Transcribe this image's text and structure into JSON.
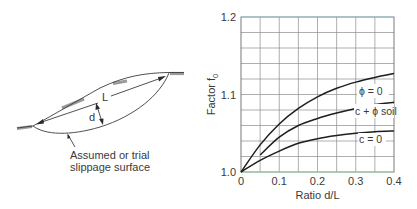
{
  "diagram": {
    "chord_label": "L",
    "depth_label": "d",
    "caption_line1": "Assumed or trial",
    "caption_line2": "slippage surface"
  },
  "chart_data": {
    "type": "line",
    "title": "",
    "xlabel": "Ratio d/L",
    "ylabel": "Factor f",
    "ylabel_subscript": "0",
    "xlim": [
      0,
      0.4
    ],
    "ylim": [
      1.0,
      1.2
    ],
    "xticks": [
      0,
      0.1,
      0.2,
      0.3,
      0.4
    ],
    "xtick_labels": [
      "0",
      "0.1",
      "0.2",
      "0.3",
      "0.4"
    ],
    "yticks": [
      1.0,
      1.1,
      1.2
    ],
    "ytick_labels": [
      "1.0",
      "1.1",
      "1.2"
    ],
    "grid": true,
    "grid_x_step": 0.05,
    "grid_y_step": 0.02,
    "series": [
      {
        "name": "φ = 0",
        "label": "ϕ = 0",
        "x": [
          0,
          0.05,
          0.1,
          0.15,
          0.2,
          0.25,
          0.3,
          0.35,
          0.4
        ],
        "y": [
          1.0,
          1.035,
          1.062,
          1.082,
          1.097,
          1.108,
          1.116,
          1.122,
          1.127
        ]
      },
      {
        "name": "c + φ soil",
        "label": "c + ϕ soil",
        "x": [
          0.05,
          0.1,
          0.15,
          0.2,
          0.25,
          0.3,
          0.35,
          0.4
        ],
        "y": [
          1.022,
          1.045,
          1.06,
          1.069,
          1.076,
          1.082,
          1.087,
          1.09
        ]
      },
      {
        "name": "c = 0",
        "label": "c = 0",
        "x": [
          0,
          0.05,
          0.1,
          0.15,
          0.2,
          0.25,
          0.3,
          0.35,
          0.4
        ],
        "y": [
          1.0,
          1.015,
          1.027,
          1.037,
          1.043,
          1.047,
          1.05,
          1.052,
          1.053
        ]
      }
    ]
  }
}
